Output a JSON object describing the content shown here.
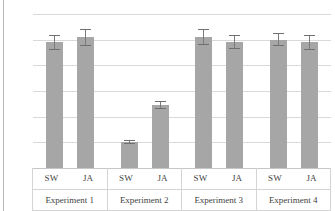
{
  "chart_data": {
    "type": "bar",
    "title": "",
    "subtitle": "",
    "xlabel": "",
    "ylabel": "",
    "ylim": [
      0,
      6
    ],
    "yticks": [
      0,
      1,
      2,
      3,
      4,
      5,
      6
    ],
    "grid": true,
    "legend": null,
    "categories": [
      "Experiment 1",
      "Experiment 2",
      "Experiment 3",
      "Experiment 4"
    ],
    "subcategories": [
      "SW",
      "JA"
    ],
    "series": [
      {
        "name": "SW",
        "values": [
          4.9,
          1.0,
          5.1,
          5.0
        ],
        "errors": [
          0.3,
          0.08,
          0.3,
          0.25
        ]
      },
      {
        "name": "JA",
        "values": [
          5.1,
          2.45,
          4.9,
          4.9
        ],
        "errors": [
          0.33,
          0.15,
          0.28,
          0.3
        ]
      }
    ],
    "bars": [
      {
        "group": "Experiment 1",
        "sub": "SW",
        "value": 4.9,
        "err_low": 4.6,
        "err_high": 5.2
      },
      {
        "group": "Experiment 1",
        "sub": "JA",
        "value": 5.1,
        "err_low": 4.77,
        "err_high": 5.43
      },
      {
        "group": "Experiment 2",
        "sub": "SW",
        "value": 1.0,
        "err_low": 0.92,
        "err_high": 1.08
      },
      {
        "group": "Experiment 2",
        "sub": "JA",
        "value": 2.45,
        "err_low": 2.3,
        "err_high": 2.6
      },
      {
        "group": "Experiment 3",
        "sub": "SW",
        "value": 5.1,
        "err_low": 4.8,
        "err_high": 5.4
      },
      {
        "group": "Experiment 3",
        "sub": "JA",
        "value": 4.9,
        "err_low": 4.62,
        "err_high": 5.18
      },
      {
        "group": "Experiment 4",
        "sub": "SW",
        "value": 5.0,
        "err_low": 4.75,
        "err_high": 5.25
      },
      {
        "group": "Experiment 4",
        "sub": "JA",
        "value": 4.9,
        "err_low": 4.6,
        "err_high": 5.2
      }
    ],
    "colors": {
      "bar_fill": "#a6a6a6",
      "error_bar": "#6f6f6f",
      "gridline": "#d9d9d9",
      "axis_text": "#4d4d4d",
      "label_text": "#3f3f3f",
      "frame": "#d4d4d4"
    }
  },
  "axis": {
    "tick_labels": [
      "6",
      "5",
      "4",
      "3",
      "2",
      "1",
      "0"
    ]
  }
}
